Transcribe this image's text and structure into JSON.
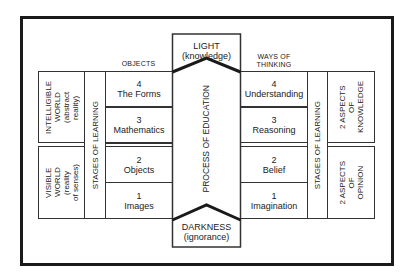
{
  "diagram": {
    "top_box": {
      "title": "LIGHT",
      "subtitle": "(knowledge)"
    },
    "bottom_box": {
      "title": "DARKNESS",
      "subtitle": "(ignorance)"
    },
    "center_column": "PROCESS OF EDUCATION",
    "left": {
      "header": "OBJECTS",
      "upper_world": {
        "title": "INTELLIGIBLE WORLD",
        "subtitle": "(abstract reality)",
        "l1": "INTELLIGIBLE",
        "l2": "WORLD",
        "l3": "(abstract",
        "l4": "reality)"
      },
      "lower_world": {
        "title": "VISIBLE WORLD",
        "subtitle": "(reality of senses)",
        "l1": "VISIBLE",
        "l2": "WORLD",
        "l3": "(reality",
        "l4": "of senses)"
      },
      "stages_label": "STAGES OF LEARNING",
      "items": [
        {
          "num": "4",
          "label": "The Forms"
        },
        {
          "num": "3",
          "label": "Mathematics"
        },
        {
          "num": "2",
          "label": "Objects"
        },
        {
          "num": "1",
          "label": "Images"
        }
      ]
    },
    "right": {
      "header_l1": "WAYS OF",
      "header_l2": "THINKING",
      "stages_label": "STAGES OF LEARNING",
      "upper_aspect": {
        "l1": "2 ASPECTS",
        "l2": "OF",
        "l3": "KNOWLEDGE"
      },
      "lower_aspect": {
        "l1": "2 ASPECTS",
        "l2": "OF",
        "l3": "OPINION"
      },
      "items": [
        {
          "num": "4",
          "label": "Understanding"
        },
        {
          "num": "3",
          "label": "Reasoning"
        },
        {
          "num": "2",
          "label": "Belief"
        },
        {
          "num": "1",
          "label": "Imagination"
        }
      ]
    }
  }
}
